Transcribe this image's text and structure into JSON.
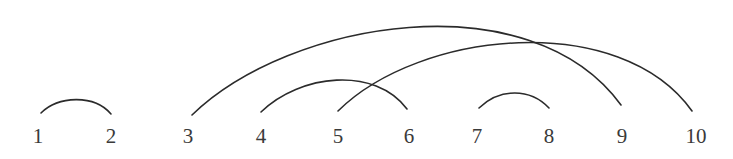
{
  "diagram": {
    "type": "arc-diagram",
    "stroke_color": "#2b2b2b",
    "label_color": "#3a3a3a",
    "nodes": [
      {
        "label": "1",
        "x": 38
      },
      {
        "label": "2",
        "x": 111
      },
      {
        "label": "3",
        "x": 188
      },
      {
        "label": "4",
        "x": 261
      },
      {
        "label": "5",
        "x": 338
      },
      {
        "label": "6",
        "x": 409
      },
      {
        "label": "7",
        "x": 477
      },
      {
        "label": "8",
        "x": 549
      },
      {
        "label": "9",
        "x": 622
      },
      {
        "label": "10",
        "x": 696
      }
    ],
    "arcs": [
      {
        "from": "1",
        "to": "2",
        "path": "M 41 113 C 58 96, 94 94, 111 114"
      },
      {
        "from": "3",
        "to": "9",
        "path": "M 192 115 C 290 20, 530 -20, 621 105"
      },
      {
        "from": "4",
        "to": "6",
        "path": "M 261 112 C 300 74, 375 66, 407 109"
      },
      {
        "from": "5",
        "to": "10",
        "path": "M 338 111 C 420 30, 620 10, 692 111"
      },
      {
        "from": "7",
        "to": "8",
        "path": "M 479 108 C 500 88, 530 88, 549 108"
      }
    ]
  }
}
